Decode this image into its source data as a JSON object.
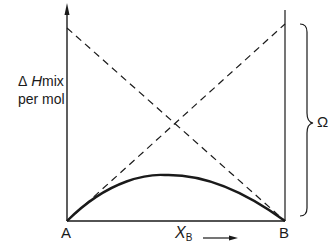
{
  "diagram": {
    "title": "",
    "y_axis": {
      "delta": "Δ",
      "symbol": "H",
      "suffix": "mix",
      "line2": "per mol"
    },
    "x_axis": {
      "symbol": "X",
      "subscript": "B",
      "direction": "→"
    },
    "points": {
      "left": "A",
      "right": "B"
    },
    "brace_label": "Ω",
    "elements": [
      {
        "type": "dashed-line",
        "from": "top-left",
        "to": "B"
      },
      {
        "type": "dashed-line",
        "from": "A",
        "to": "top-right"
      },
      {
        "type": "solid-curve",
        "shape": "arch",
        "from": "A",
        "to": "B"
      },
      {
        "type": "brace",
        "spans": "right vertical axis height",
        "label": "Ω"
      }
    ]
  }
}
